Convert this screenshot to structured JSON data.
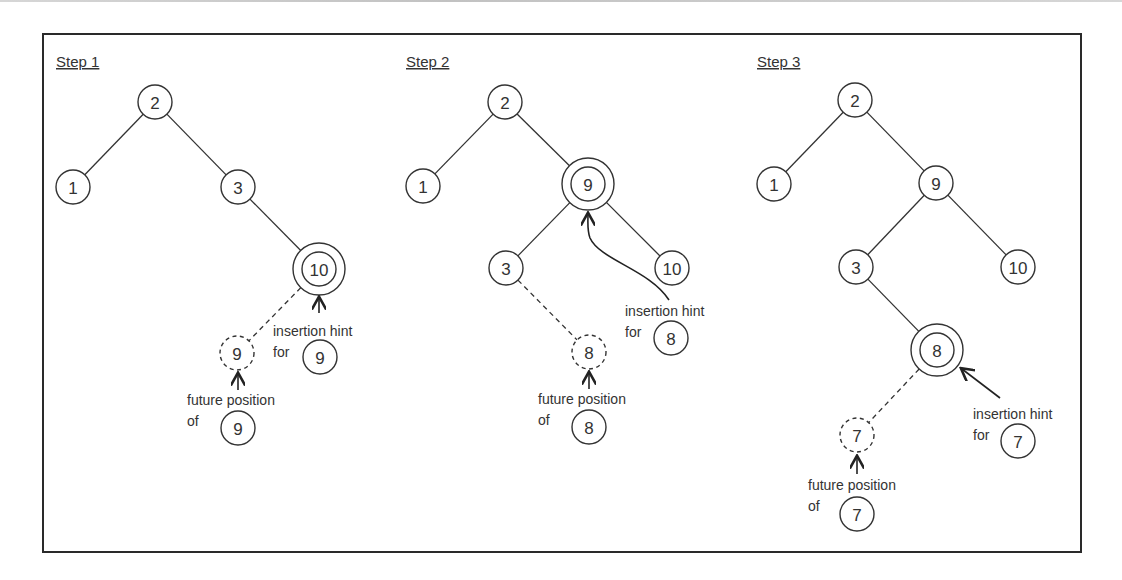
{
  "diagram": {
    "steps": [
      {
        "title": "Step 1",
        "title_pos": [
          56,
          67
        ],
        "nodes": [
          {
            "id": "2",
            "label": "2",
            "x": 155,
            "y": 102,
            "style": "normal"
          },
          {
            "id": "1",
            "label": "1",
            "x": 73,
            "y": 187,
            "style": "normal"
          },
          {
            "id": "3",
            "label": "3",
            "x": 238,
            "y": 187,
            "style": "normal"
          },
          {
            "id": "10",
            "label": "10",
            "x": 319,
            "y": 269,
            "style": "hint"
          },
          {
            "id": "9f",
            "label": "9",
            "x": 237,
            "y": 353,
            "style": "future"
          }
        ],
        "edges": [
          {
            "from": "2",
            "to": "1",
            "style": "solid"
          },
          {
            "from": "2",
            "to": "3",
            "style": "solid"
          },
          {
            "from": "3",
            "to": "10",
            "style": "solid"
          },
          {
            "from": "10",
            "to": "9f",
            "style": "dashed"
          }
        ],
        "hint_annotation": {
          "line1": "insertion hint",
          "line2": "for",
          "value": "9",
          "text_x": 273,
          "text_y": 336,
          "circle_x": 320,
          "circle_y": 357
        },
        "future_annotation": {
          "line1": "future position",
          "line2": "of",
          "value": "9",
          "text_x": 187,
          "text_y": 405,
          "circle_x": 238,
          "circle_y": 428
        },
        "hint_arrow": "M 319 313 L 319 298",
        "future_arrow": "M 238 390 L 238 374"
      },
      {
        "title": "Step 2",
        "title_pos": [
          406,
          67
        ],
        "nodes": [
          {
            "id": "2",
            "label": "2",
            "x": 505,
            "y": 102,
            "style": "normal"
          },
          {
            "id": "1",
            "label": "1",
            "x": 423,
            "y": 186,
            "style": "normal"
          },
          {
            "id": "9",
            "label": "9",
            "x": 588,
            "y": 184,
            "style": "hint"
          },
          {
            "id": "3",
            "label": "3",
            "x": 506,
            "y": 268,
            "style": "normal"
          },
          {
            "id": "10",
            "label": "10",
            "x": 672,
            "y": 268,
            "style": "normal"
          },
          {
            "id": "8f",
            "label": "8",
            "x": 589,
            "y": 352,
            "style": "future"
          }
        ],
        "edges": [
          {
            "from": "2",
            "to": "1",
            "style": "solid"
          },
          {
            "from": "2",
            "to": "9",
            "style": "solid"
          },
          {
            "from": "9",
            "to": "3",
            "style": "solid"
          },
          {
            "from": "9",
            "to": "10",
            "style": "solid"
          },
          {
            "from": "3",
            "to": "8f",
            "style": "dashed"
          }
        ],
        "hint_annotation": {
          "line1": "insertion hint",
          "line2": "for",
          "value": "8",
          "text_x": 625,
          "text_y": 316,
          "circle_x": 671,
          "circle_y": 338
        },
        "future_annotation": {
          "line1": "future position",
          "line2": "of",
          "value": "8",
          "text_x": 538,
          "text_y": 404,
          "circle_x": 589,
          "circle_y": 427
        },
        "hint_arrow": "M 669 300 C 650 270, 600 260, 590 238 C 587 230, 588 222, 588 214",
        "future_arrow": "M 589 389 L 589 373"
      },
      {
        "title": "Step 3",
        "title_pos": [
          757,
          67
        ],
        "nodes": [
          {
            "id": "2",
            "label": "2",
            "x": 855,
            "y": 100,
            "style": "normal"
          },
          {
            "id": "1",
            "label": "1",
            "x": 774,
            "y": 184,
            "style": "normal"
          },
          {
            "id": "9",
            "label": "9",
            "x": 936,
            "y": 183,
            "style": "normal"
          },
          {
            "id": "3",
            "label": "3",
            "x": 856,
            "y": 267,
            "style": "normal"
          },
          {
            "id": "10",
            "label": "10",
            "x": 1018,
            "y": 267,
            "style": "normal"
          },
          {
            "id": "8",
            "label": "8",
            "x": 937,
            "y": 350,
            "style": "hint"
          },
          {
            "id": "7f",
            "label": "7",
            "x": 857,
            "y": 435,
            "style": "future"
          }
        ],
        "edges": [
          {
            "from": "2",
            "to": "1",
            "style": "solid"
          },
          {
            "from": "2",
            "to": "9",
            "style": "solid"
          },
          {
            "from": "9",
            "to": "3",
            "style": "solid"
          },
          {
            "from": "9",
            "to": "10",
            "style": "solid"
          },
          {
            "from": "3",
            "to": "8",
            "style": "solid"
          },
          {
            "from": "8",
            "to": "7f",
            "style": "dashed"
          }
        ],
        "hint_annotation": {
          "line1": "insertion hint",
          "line2": "for",
          "value": "7",
          "text_x": 973,
          "text_y": 419,
          "circle_x": 1018,
          "circle_y": 441
        },
        "future_annotation": {
          "line1": "future position",
          "line2": "of",
          "value": "7",
          "text_x": 808,
          "text_y": 490,
          "circle_x": 857,
          "circle_y": 514
        },
        "hint_arrow": "M 1000 398 L 962 369",
        "future_arrow": "M 857 474 L 857 457"
      }
    ]
  }
}
